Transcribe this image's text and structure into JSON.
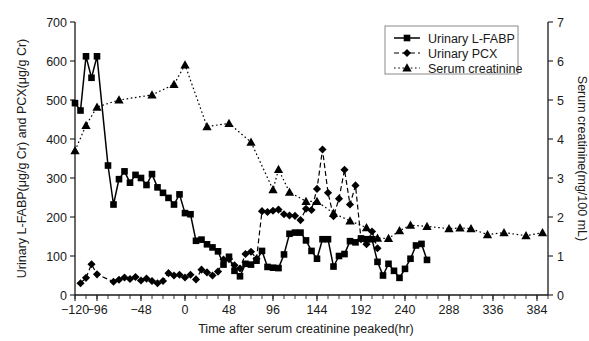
{
  "chart_data": {
    "type": "line",
    "title": "",
    "xlabel": "Time after serum creatinine peaked(hr)",
    "ylabel": "Urinary L-FABP(μg/g Cr) and PCX(μg/g Cr)",
    "y2label": "Serum creatinine(mg/100 mL)",
    "xlim": [
      -120,
      396
    ],
    "ylim": [
      0,
      700
    ],
    "y2lim": [
      0,
      7
    ],
    "xticks": [
      -120,
      -96,
      -48,
      0,
      48,
      96,
      144,
      192,
      240,
      288,
      336,
      384
    ],
    "xticklabels": [
      "−120",
      "−96",
      "−48",
      "0",
      "48",
      "96",
      "144",
      "192",
      "240",
      "288",
      "336",
      "384"
    ],
    "xtick_minor_step": 12,
    "yticks": [
      0,
      100,
      200,
      300,
      400,
      500,
      600,
      700
    ],
    "yticklabels": [
      "0",
      "100",
      "200",
      "300",
      "400",
      "500",
      "600",
      "700"
    ],
    "y2ticks": [
      0,
      1,
      2,
      3,
      4,
      5,
      6,
      7
    ],
    "y2ticklabels": [
      "0",
      "1",
      "2",
      "3",
      "4",
      "5",
      "6",
      "7"
    ],
    "grid": false,
    "legend_position": "top-right",
    "series": [
      {
        "name": "Urinary L-FABP",
        "axis": "left",
        "marker": "square",
        "linestyle": "solid",
        "color": "#000000",
        "points": [
          [
            -120,
            492
          ],
          [
            -114,
            473
          ],
          [
            -108,
            612
          ],
          [
            -102,
            557
          ],
          [
            -96,
            612
          ],
          [
            -84,
            332
          ],
          [
            -78,
            232
          ],
          [
            -72,
            297
          ],
          [
            -66,
            317
          ],
          [
            -60,
            288
          ],
          [
            -54,
            308
          ],
          [
            -48,
            300
          ],
          [
            -42,
            282
          ],
          [
            -36,
            310
          ],
          [
            -30,
            276
          ],
          [
            -24,
            262
          ],
          [
            -18,
            249
          ],
          [
            -12,
            232
          ],
          [
            -6,
            258
          ],
          [
            0,
            210
          ],
          [
            6,
            207
          ],
          [
            12,
            139
          ],
          [
            18,
            142
          ],
          [
            24,
            130
          ],
          [
            30,
            122
          ],
          [
            36,
            112
          ],
          [
            42,
            78
          ],
          [
            48,
            98
          ],
          [
            54,
            62
          ],
          [
            60,
            48
          ],
          [
            66,
            80
          ],
          [
            72,
            78
          ],
          [
            78,
            88
          ],
          [
            84,
            113
          ],
          [
            90,
            72
          ],
          [
            96,
            70
          ],
          [
            102,
            69
          ],
          [
            108,
            104
          ],
          [
            114,
            157
          ],
          [
            120,
            160
          ],
          [
            126,
            160
          ],
          [
            132,
            140
          ],
          [
            138,
            113
          ],
          [
            144,
            93
          ],
          [
            150,
            143
          ],
          [
            156,
            143
          ],
          [
            162,
            73
          ],
          [
            168,
            100
          ],
          [
            174,
            105
          ],
          [
            180,
            138
          ],
          [
            186,
            135
          ],
          [
            192,
            145
          ],
          [
            198,
            143
          ],
          [
            204,
            143
          ],
          [
            210,
            85
          ],
          [
            216,
            50
          ],
          [
            222,
            80
          ],
          [
            228,
            62
          ],
          [
            234,
            44
          ],
          [
            240,
            67
          ],
          [
            246,
            93
          ],
          [
            252,
            127
          ],
          [
            258,
            131
          ],
          [
            264,
            90
          ]
        ]
      },
      {
        "name": "Urinary PCX",
        "axis": "left",
        "marker": "diamond",
        "linestyle": "dashed",
        "color": "#000000",
        "points": [
          [
            -114,
            30
          ],
          [
            -108,
            44
          ],
          [
            -102,
            79
          ],
          [
            -96,
            53
          ],
          [
            -78,
            34
          ],
          [
            -72,
            39
          ],
          [
            -66,
            45
          ],
          [
            -60,
            41
          ],
          [
            -54,
            46
          ],
          [
            -48,
            37
          ],
          [
            -42,
            42
          ],
          [
            -36,
            36
          ],
          [
            -30,
            30
          ],
          [
            -24,
            36
          ],
          [
            -18,
            56
          ],
          [
            -12,
            50
          ],
          [
            -6,
            52
          ],
          [
            0,
            45
          ],
          [
            6,
            52
          ],
          [
            12,
            40
          ],
          [
            18,
            65
          ],
          [
            24,
            58
          ],
          [
            30,
            50
          ],
          [
            36,
            60
          ],
          [
            42,
            91
          ],
          [
            48,
            92
          ],
          [
            54,
            76
          ],
          [
            60,
            68
          ],
          [
            66,
            105
          ],
          [
            72,
            111
          ],
          [
            78,
            93
          ],
          [
            84,
            215
          ],
          [
            90,
            213
          ],
          [
            96,
            216
          ],
          [
            102,
            219
          ],
          [
            108,
            207
          ],
          [
            114,
            204
          ],
          [
            120,
            203
          ],
          [
            126,
            192
          ],
          [
            132,
            221
          ],
          [
            138,
            218
          ],
          [
            144,
            272
          ],
          [
            150,
            373
          ],
          [
            156,
            262
          ],
          [
            162,
            202
          ],
          [
            168,
            247
          ],
          [
            174,
            321
          ],
          [
            180,
            232
          ],
          [
            186,
            281
          ],
          [
            192,
            143
          ],
          [
            198,
            130
          ],
          [
            204,
            163
          ],
          [
            210,
            120
          ]
        ]
      },
      {
        "name": "Serum creatinine",
        "axis": "right",
        "marker": "triangle",
        "linestyle": "dotted",
        "color": "#000000",
        "points": [
          [
            -120,
            3.7
          ],
          [
            -108,
            4.35
          ],
          [
            -96,
            4.82
          ],
          [
            -72,
            5.0
          ],
          [
            -36,
            5.13
          ],
          [
            -12,
            5.4
          ],
          [
            0,
            5.9
          ],
          [
            24,
            4.32
          ],
          [
            48,
            4.4
          ],
          [
            72,
            3.92
          ],
          [
            96,
            2.7
          ],
          [
            102,
            3.22
          ],
          [
            114,
            2.64
          ],
          [
            132,
            2.4
          ],
          [
            144,
            2.4
          ],
          [
            162,
            2.1
          ],
          [
            180,
            1.9
          ],
          [
            198,
            1.73
          ],
          [
            210,
            1.46
          ],
          [
            222,
            1.45
          ],
          [
            234,
            1.65
          ],
          [
            246,
            1.79
          ],
          [
            264,
            1.76
          ],
          [
            288,
            1.7
          ],
          [
            300,
            1.72
          ],
          [
            312,
            1.7
          ],
          [
            330,
            1.55
          ],
          [
            348,
            1.6
          ],
          [
            372,
            1.52
          ],
          [
            390,
            1.6
          ]
        ]
      }
    ]
  },
  "legend": {
    "items": [
      {
        "label": "Urinary L-FABP",
        "marker": "square",
        "linestyle": "solid"
      },
      {
        "label": "Urinary PCX",
        "marker": "diamond",
        "linestyle": "dashed"
      },
      {
        "label": "Serum creatinine",
        "marker": "triangle",
        "linestyle": "dotted"
      }
    ]
  }
}
